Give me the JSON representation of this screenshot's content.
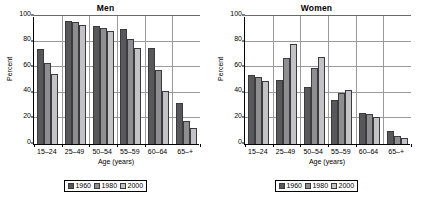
{
  "chart_data": [
    {
      "type": "bar",
      "title": "Men",
      "xlabel": "Age (years)",
      "ylabel": "Percent",
      "categories": [
        "15–24",
        "25–49",
        "50–54",
        "55–59",
        "60–64",
        "65–+"
      ],
      "ylim": [
        0,
        100
      ],
      "yticks": [
        0,
        20,
        40,
        60,
        80,
        100
      ],
      "grid": true,
      "legend_position": "bottom",
      "series": [
        {
          "name": "1960",
          "color": "#58585a",
          "values": [
            74,
            96,
            92,
            89.5,
            75,
            32
          ]
        },
        {
          "name": "1980",
          "color": "#8e8e90",
          "values": [
            63,
            95,
            91,
            82,
            57.5,
            18
          ]
        },
        {
          "name": "2000",
          "color": "#c3c3c5",
          "values": [
            55,
            93,
            88.5,
            75,
            41.5,
            12.5
          ]
        }
      ]
    },
    {
      "type": "bar",
      "title": "Women",
      "xlabel": "Age (years)",
      "ylabel": "Percent",
      "categories": [
        "15–24",
        "25–49",
        "50–54",
        "55–59",
        "60–64",
        "65–+"
      ],
      "ylim": [
        0,
        100
      ],
      "yticks": [
        0,
        20,
        40,
        60,
        80,
        100
      ],
      "grid": true,
      "legend_position": "bottom",
      "series": [
        {
          "name": "1960",
          "color": "#58585a",
          "values": [
            54,
            50,
            44.5,
            34.5,
            24,
            10
          ]
        },
        {
          "name": "1980",
          "color": "#8e8e90",
          "values": [
            52.5,
            67,
            59.5,
            40,
            23.5,
            6
          ]
        },
        {
          "name": "2000",
          "color": "#c3c3c5",
          "values": [
            49,
            78,
            68,
            42.5,
            21,
            4.5
          ]
        }
      ]
    }
  ]
}
